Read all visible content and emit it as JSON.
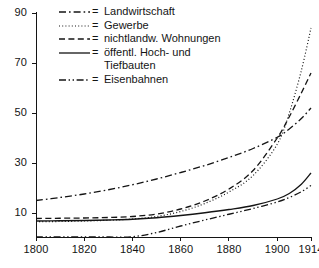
{
  "chart_data": {
    "type": "line",
    "title": "",
    "xlabel": "",
    "ylabel": "",
    "xlim": [
      1800,
      1914
    ],
    "ylim": [
      0.4,
      90
    ],
    "grid": false,
    "legend_position": "top-left",
    "xticks": [
      1800,
      1820,
      1840,
      1860,
      1880,
      1900,
      1914
    ],
    "yticks": [
      10,
      30,
      50,
      70,
      90
    ],
    "x": [
      1800,
      1810,
      1820,
      1830,
      1840,
      1850,
      1860,
      1870,
      1880,
      1890,
      1900,
      1905,
      1910,
      1914
    ],
    "series": [
      {
        "name": "Landwirtschaft",
        "style": "dash-dot",
        "values": [
          15.0,
          16.2,
          17.6,
          19.3,
          21.3,
          23.6,
          26.2,
          29.0,
          32.2,
          35.8,
          40.3,
          43.6,
          47.8,
          52.0
        ]
      },
      {
        "name": "Gewerbe",
        "style": "dotted",
        "values": [
          6.5,
          6.6,
          6.8,
          7.1,
          7.6,
          8.6,
          10.6,
          13.8,
          18.4,
          25.0,
          37.5,
          50.0,
          67.0,
          84.0
        ]
      },
      {
        "name": "nichtlandw. Wohnungen",
        "style": "dashed",
        "values": [
          7.8,
          7.9,
          8.0,
          8.2,
          8.6,
          9.6,
          11.6,
          14.8,
          19.6,
          27.0,
          40.0,
          48.5,
          58.0,
          66.0
        ]
      },
      {
        "name": "öffentl. Hoch- und Tiefbauten",
        "style": "solid",
        "values": [
          6.8,
          6.9,
          7.0,
          7.2,
          7.5,
          8.1,
          9.0,
          10.1,
          11.4,
          13.0,
          15.6,
          17.8,
          21.5,
          26.0
        ]
      },
      {
        "name": "Eisenbahnen",
        "style": "dash-dot-dot",
        "values": [
          0.4,
          0.4,
          0.4,
          0.4,
          0.5,
          2.2,
          4.8,
          7.2,
          9.5,
          11.8,
          14.4,
          16.2,
          18.5,
          21.0
        ]
      }
    ]
  },
  "legend": {
    "equals_sign": "=",
    "entries": [
      {
        "label": "Landwirtschaft",
        "style": "dash-dot"
      },
      {
        "label": "Gewerbe",
        "style": "dotted"
      },
      {
        "label": "nichtlandw. Wohnungen",
        "style": "dashed"
      },
      {
        "label": "öffentl. Hoch- und",
        "label_cont": "Tiefbauten",
        "style": "solid"
      },
      {
        "label": "Eisenbahnen",
        "style": "dash-dot-dot"
      }
    ]
  },
  "axes": {
    "y_tick_labels": [
      "90",
      "70",
      "50",
      "30",
      "10"
    ],
    "x_tick_labels": [
      "1800",
      "1820",
      "1840",
      "1860",
      "1880",
      "1900",
      "1914"
    ]
  },
  "colors": {
    "line": "#141414",
    "axis": "#141414",
    "background": "#ffffff"
  }
}
